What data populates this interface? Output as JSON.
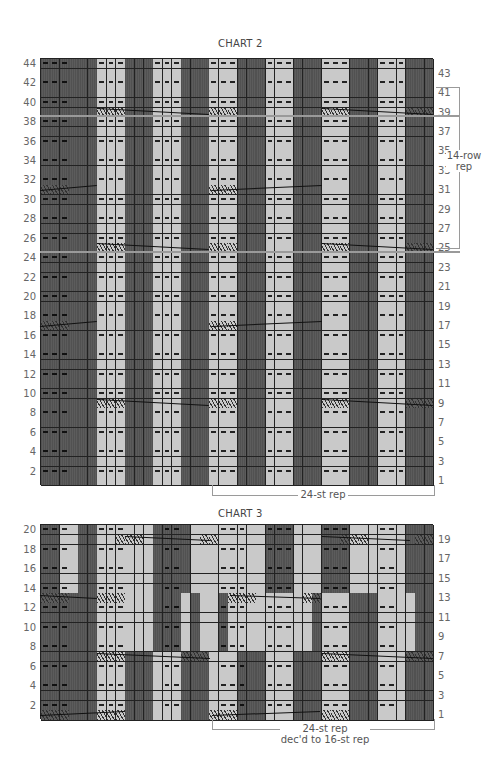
{
  "chart2": {
    "title": "CHART 2",
    "left_rows": [
      "44",
      "42",
      "40",
      "38",
      "36",
      "34",
      "32",
      "30",
      "28",
      "26",
      "24",
      "22",
      "20",
      "18",
      "16",
      "14",
      "12",
      "10",
      "8",
      "6",
      "4",
      "2"
    ],
    "right_rows": [
      "43",
      "41",
      "39",
      "37",
      "35",
      "33",
      "31",
      "29",
      "27",
      "25",
      "23",
      "21",
      "19",
      "17",
      "15",
      "13",
      "11",
      "9",
      "7",
      "5",
      "3",
      "1"
    ],
    "columns": 42,
    "rows": 44,
    "row_pattern_even": "PPPDDDPPPDDDPPPDDDPPPDDDPPPDDDPPPDDDPPPDDD",
    "row_pattern_odd": "DDDDDDLLLDDDLLLDDDLLLDDDLLLDDDLLLDDDLLLDDD",
    "light_columns_note": "light bands at cols 6-8,12-14,18-20,24-26,30-32,36-38",
    "gray_lines_after_rows": [
      38,
      24
    ],
    "cable_rows": [
      39,
      31,
      25,
      17,
      9
    ],
    "row_rep_label": "14-row rep",
    "stitch_rep_label": "24-st rep"
  },
  "chart3": {
    "title": "CHART 3",
    "left_rows": [
      "20",
      "18",
      "16",
      "14",
      "12",
      "10",
      "8",
      "6",
      "4",
      "2"
    ],
    "right_rows": [
      "19",
      "17",
      "15",
      "13",
      "11",
      "9",
      "7",
      "5",
      "3",
      "1"
    ],
    "columns": 42,
    "rows": 20,
    "cable_rows": [
      19,
      13,
      7,
      1
    ],
    "stitch_rep_label": "24-st rep",
    "stitch_rep_label_2": "dec'd to 16-st rep"
  }
}
